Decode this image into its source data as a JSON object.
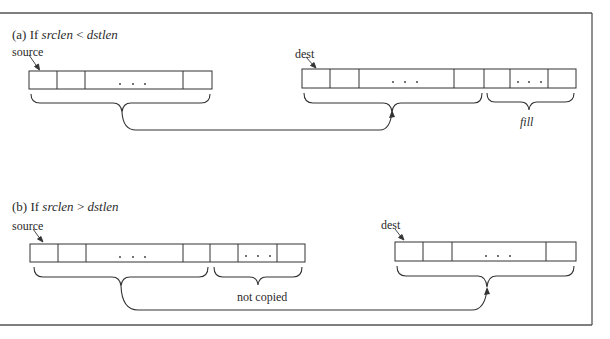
{
  "figure": {
    "panel_a": {
      "heading_prefix": "(a)  If ",
      "heading_var1": "srclen",
      "heading_op": " < ",
      "heading_var2": "dstlen",
      "source_label": "source",
      "dest_label": "dest",
      "ellipsis": ". . .",
      "fill_label": "fill"
    },
    "panel_b": {
      "heading_prefix": "(b)  If ",
      "heading_var1": "srclen",
      "heading_op": " > ",
      "heading_var2": "dstlen",
      "source_label": "source",
      "dest_label": "dest",
      "ellipsis": ". . .",
      "not_copied_label": "not copied"
    },
    "colors": {
      "line": "#333333",
      "frame": "#555555",
      "background": "#ffffff"
    }
  }
}
